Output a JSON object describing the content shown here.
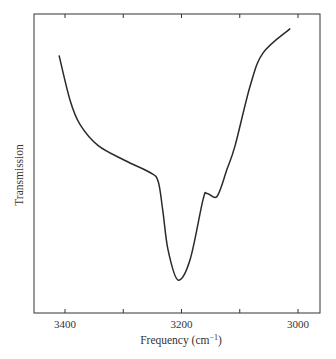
{
  "chart_data": {
    "type": "line",
    "title": "",
    "xlabel": "Frequency (cm−1)",
    "xlabel_base": "Frequency (cm",
    "xlabel_sup": "−1",
    "xlabel_close": ")",
    "ylabel": "Transmission",
    "xlim": [
      3410,
      2960
    ],
    "x_reversed": true,
    "ylim": [
      0,
      100
    ],
    "grid": false,
    "legend": null,
    "x_ticks_major": [
      3400,
      3200,
      3000
    ],
    "x_ticks_minor": [
      3300,
      3100
    ],
    "x_tick_labels": [
      "3400",
      "3200",
      "3000"
    ],
    "y_ticks": [],
    "series": [
      {
        "name": "IR transmission",
        "color": "#2a2a2a",
        "x": [
          3410,
          3391,
          3374,
          3343,
          3297,
          3254,
          3240,
          3232,
          3223,
          3206,
          3185,
          3163,
          3156,
          3139,
          3122,
          3108,
          3082,
          3060,
          3014
        ],
        "values": [
          86,
          71,
          63,
          56,
          51,
          47,
          44,
          34,
          21,
          11,
          18,
          38,
          40,
          39,
          48,
          56,
          76,
          87,
          95
        ]
      }
    ],
    "annotations": []
  }
}
